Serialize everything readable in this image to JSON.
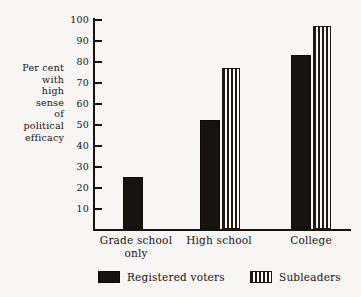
{
  "chart_data": {
    "type": "bar",
    "title": "",
    "subtitle": "",
    "xlabel": "",
    "ylabel": "Per cent with high sense of political efficacy",
    "ylabel_lines": [
      "Per cent",
      "with",
      "high",
      "sense",
      "of",
      "political",
      "efficacy"
    ],
    "categories": [
      "Grade school only",
      "High school",
      "College"
    ],
    "category_label_lines": [
      [
        "Grade school",
        "only"
      ],
      [
        "High school"
      ],
      [
        "College"
      ]
    ],
    "series": [
      {
        "name": "Registered voters",
        "fill": "solid-black",
        "color": "#17140f",
        "values": [
          25,
          52,
          83
        ]
      },
      {
        "name": "Subleaders",
        "fill": "vertical-stripes",
        "color": "#1e1a16",
        "values": [
          null,
          77,
          97
        ]
      }
    ],
    "ylim": [
      0,
      100
    ],
    "y_ticks": [
      10,
      20,
      30,
      40,
      50,
      60,
      70,
      80,
      90,
      100
    ],
    "y_tick_labels": [
      "10",
      "20",
      "30",
      "40",
      "50",
      "60",
      "70",
      "80",
      "90",
      "100"
    ],
    "grid": false,
    "legend_position": "bottom"
  },
  "legend": {
    "items": [
      {
        "label": "Registered voters",
        "swatch": "solid-black-swatch"
      },
      {
        "label": "Subleaders",
        "swatch": "striped-swatch"
      }
    ]
  },
  "colors": {
    "background": "#f7f6f4",
    "ink": "#15120f",
    "bar_solid": "#17140f",
    "bar_stripe": "#1e1a16",
    "bar_stripe_gap": "#fbfaf8"
  }
}
